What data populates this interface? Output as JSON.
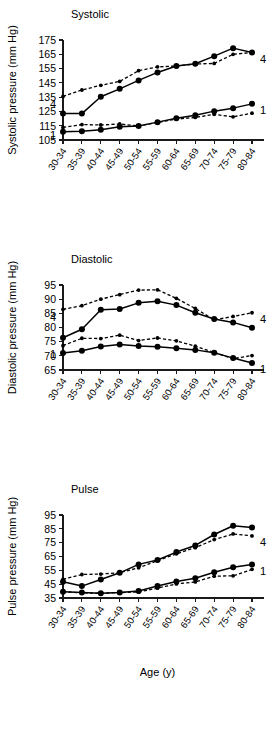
{
  "figure": {
    "xlabel": "Age (y)",
    "categories": [
      "30-34",
      "35-39",
      "40-44",
      "45-49",
      "50-54",
      "55-59",
      "60-64",
      "65-69",
      "70-74",
      "75-79",
      "80-84"
    ],
    "series_end_labels": {
      "solid": "1",
      "dashed": "4"
    },
    "series_start_labels": {
      "solid": "1",
      "dashed": "4"
    }
  },
  "chart_data": [
    {
      "type": "line",
      "title": "Systolic",
      "xlabel": "Age (y)",
      "ylabel": "Systolic pressure (mm Hg)",
      "ylim": [
        105,
        175
      ],
      "yticks": [
        105,
        115,
        125,
        135,
        145,
        155,
        165,
        175
      ],
      "grid": false,
      "legend_position": "line-end-labels",
      "categories": [
        "30-34",
        "35-39",
        "40-44",
        "45-49",
        "50-54",
        "55-59",
        "60-64",
        "65-69",
        "70-74",
        "75-79",
        "80-84"
      ],
      "series": [
        {
          "name": "4",
          "style": "dashed",
          "marker": "small",
          "start_label": "4",
          "end_label": "4",
          "values": [
            135.5,
            140.0,
            143.3,
            146.0,
            153.5,
            156.2,
            156.8,
            158.2,
            158.6,
            165.0,
            166.2
          ]
        },
        {
          "name": "1 (upper solid)",
          "style": "solid",
          "marker": "big",
          "start_label": "",
          "end_label": "",
          "values": [
            123.5,
            123.5,
            135.3,
            140.8,
            146.7,
            152.3,
            156.8,
            158.4,
            163.7,
            169.3,
            166.3
          ]
        },
        {
          "name": "4 lower",
          "style": "dashed",
          "marker": "small",
          "start_label": "1",
          "end_label": "",
          "values": [
            113.8,
            115.8,
            115.5,
            116.2,
            114.8,
            117.3,
            119.6,
            120.8,
            123.0,
            121.2,
            123.8
          ]
        },
        {
          "name": "1",
          "style": "solid",
          "marker": "big",
          "start_label": "",
          "end_label": "1",
          "values": [
            110.8,
            111.2,
            112.2,
            114.2,
            114.8,
            117.5,
            120.2,
            122.3,
            125.2,
            127.3,
            130.3
          ]
        }
      ]
    },
    {
      "type": "line",
      "title": "Diastolic",
      "xlabel": "Age (y)",
      "ylabel": "Diastolic pressure (mm Hg)",
      "ylim": [
        65,
        95
      ],
      "yticks": [
        65,
        70,
        75,
        80,
        85,
        90,
        95
      ],
      "grid": false,
      "legend_position": "line-end-labels",
      "categories": [
        "30-34",
        "35-39",
        "40-44",
        "45-49",
        "50-54",
        "55-59",
        "60-64",
        "65-69",
        "70-74",
        "75-79",
        "80-84"
      ],
      "series": [
        {
          "name": "4",
          "style": "dashed",
          "marker": "small",
          "start_label": "4",
          "end_label": "4",
          "values": [
            86.4,
            87.7,
            90.0,
            91.6,
            93.2,
            93.3,
            90.3,
            86.7,
            82.7,
            83.9,
            85.2
          ]
        },
        {
          "name": "1 (upper solid)",
          "style": "solid",
          "marker": "big",
          "start_label": "",
          "end_label": "",
          "values": [
            76.4,
            79.4,
            86.3,
            86.5,
            88.7,
            89.3,
            87.9,
            85.2,
            83.0,
            81.8,
            79.9
          ]
        },
        {
          "name": "4 lower",
          "style": "dashed",
          "marker": "small",
          "start_label": "1",
          "end_label": "",
          "values": [
            73.6,
            76.2,
            76.1,
            77.3,
            75.4,
            76.3,
            75.3,
            73.4,
            71.2,
            69.0,
            70.1
          ]
        },
        {
          "name": "1",
          "style": "solid",
          "marker": "big",
          "start_label": "",
          "end_label": "1",
          "values": [
            71.0,
            71.8,
            73.3,
            74.0,
            73.5,
            73.2,
            72.7,
            72.1,
            71.1,
            69.2,
            67.5
          ]
        }
      ]
    },
    {
      "type": "line",
      "title": "Pulse",
      "xlabel": "Age (y)",
      "ylabel": "Pulse pressure (mm Hg)",
      "ylim": [
        35,
        95
      ],
      "yticks": [
        35,
        45,
        55,
        65,
        75,
        85,
        95
      ],
      "grid": false,
      "legend_position": "line-end-labels",
      "categories": [
        "30-34",
        "35-39",
        "40-44",
        "45-49",
        "50-54",
        "55-59",
        "60-64",
        "65-69",
        "70-74",
        "75-79",
        "80-84"
      ],
      "series": [
        {
          "name": "4",
          "style": "dashed",
          "marker": "small",
          "start_label": "",
          "end_label": "4",
          "values": [
            48.5,
            52.0,
            52.3,
            53.3,
            56.8,
            62.0,
            66.9,
            71.4,
            77.2,
            81.3,
            79.9
          ]
        },
        {
          "name": "1 (upper solid)",
          "style": "solid",
          "marker": "big",
          "start_label": "",
          "end_label": "",
          "values": [
            46.8,
            43.6,
            48.4,
            53.2,
            59.3,
            62.5,
            68.2,
            73.0,
            80.9,
            87.2,
            85.9
          ]
        },
        {
          "name": "4 lower",
          "style": "dashed",
          "marker": "small",
          "start_label": "",
          "end_label": "",
          "values": [
            39.6,
            38.7,
            38.4,
            38.9,
            39.4,
            42.1,
            45.2,
            46.6,
            50.8,
            51.0,
            55.7
          ]
        },
        {
          "name": "1",
          "style": "solid",
          "marker": "big",
          "start_label": "",
          "end_label": "1",
          "values": [
            39.6,
            38.9,
            38.4,
            39.0,
            40.0,
            43.7,
            47.0,
            49.3,
            53.6,
            57.2,
            59.2
          ]
        }
      ]
    }
  ]
}
